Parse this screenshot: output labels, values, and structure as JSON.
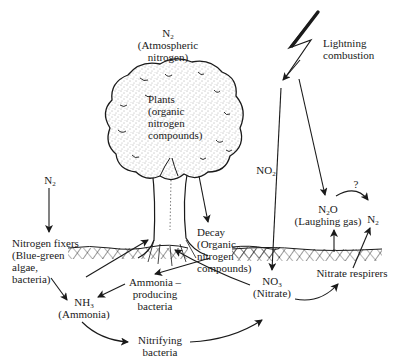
{
  "labels": {
    "atmospheric_n2": {
      "formula": "N",
      "sub": "2",
      "caption_line1": "(Atmospheric",
      "caption_line2": "nitrogen)"
    },
    "plants": {
      "line1": "Plants",
      "line2": "(organic",
      "line3": "nitrogen",
      "line4": "compounds)"
    },
    "lightning": {
      "line1": "Lightning",
      "line2": "combustion"
    },
    "no2": {
      "formula": "NO",
      "sub": "2"
    },
    "left_n2": {
      "formula": "N",
      "sub": "2"
    },
    "nitrogen_fixers": {
      "line1": "Nitrogen fixers",
      "line2": "(Blue-green",
      "line3": "algae,",
      "line4": "bacteria)"
    },
    "decay": {
      "line1": "Decay",
      "line2": "(Organic",
      "line3": "nitrogen",
      "line4": "compounds)"
    },
    "n2o": {
      "formula_a": "N",
      "sub": "2",
      "formula_b": "O",
      "caption": "(Laughing gas)"
    },
    "right_n2": {
      "formula": "N",
      "sub": "2"
    },
    "question": "?",
    "ammonia_producing": {
      "line1": "Ammonia –",
      "line2": "producing",
      "line3": "bacteria"
    },
    "nh3": {
      "formula": "NH",
      "sub": "3",
      "caption": "(Ammonia)"
    },
    "no3": {
      "formula": "NO",
      "sub": "3",
      "caption": "(Nitrate)"
    },
    "nitrate_respirers": "Nitrate respirers",
    "nitrifying": {
      "line1": "Nitrifying",
      "line2": "bacteria"
    }
  },
  "colors": {
    "ink": "#1a1a1a",
    "paper": "#ffffff",
    "foliage": "#f4f4f4"
  }
}
